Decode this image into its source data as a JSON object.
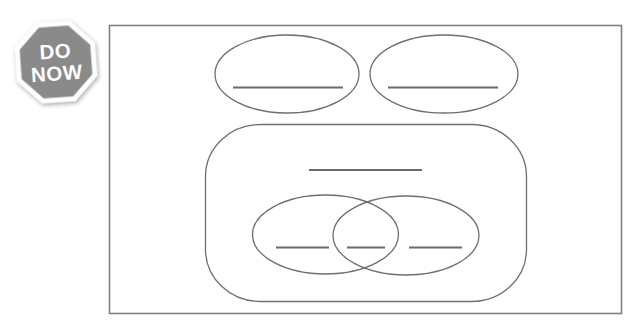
{
  "badge": {
    "line1": "DO",
    "line2": "NOW"
  },
  "organizer": {
    "top_ovals": [
      {
        "blank": ""
      },
      {
        "blank": ""
      }
    ],
    "main_box": {
      "title_blank": ""
    },
    "venn": {
      "left_blank": "",
      "overlap_blank": "",
      "right_blank": ""
    }
  },
  "colors": {
    "background": "#ffffff",
    "badge_fill": "#8a8a8a",
    "badge_border": "#ffffff",
    "badge_text": "#ffffff",
    "frame_stroke": "#808080",
    "shape_stroke": "#6f6f6f",
    "blank_line": "#6a6a6a"
  }
}
